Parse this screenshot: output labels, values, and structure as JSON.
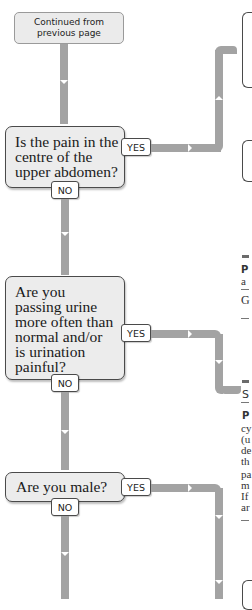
{
  "flowchart": {
    "start": {
      "label": "Continued from previous page"
    },
    "questions": [
      {
        "text": "Is the pain in the centre of the upper abdomen?",
        "yes_label": "YES",
        "no_label": "NO"
      },
      {
        "text": "Are you passing urine more often than normal and/or is urination painful?",
        "yes_label": "YES",
        "no_label": "NO"
      },
      {
        "text": "Are you male?",
        "yes_label": "YES",
        "no_label": "NO"
      }
    ]
  },
  "right_column_fragments": {
    "panel1": {
      "line1": "P",
      "line2": "a",
      "line3": "G"
    },
    "panel2": {
      "heading": "S",
      "lines": [
        "P",
        "cy",
        "(u",
        "de",
        "th",
        "pa",
        "m",
        "If",
        "ar"
      ]
    }
  },
  "colors": {
    "arrow": "#a3a3a3",
    "box_fill": "#ececec",
    "box_border": "#4a4a4a"
  }
}
